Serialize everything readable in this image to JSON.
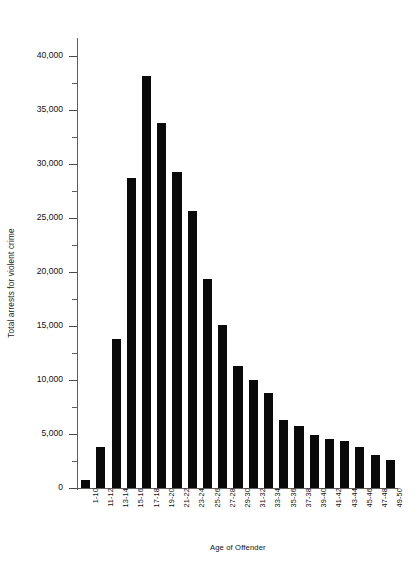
{
  "chart_data": {
    "type": "bar",
    "title": "",
    "xlabel": "Age of Offender",
    "ylabel": "Total arrests for violent crime",
    "ylim": [
      0,
      41500
    ],
    "grid": false,
    "legend": null,
    "y_ticks_major": [
      0,
      5000,
      10000,
      15000,
      20000,
      25000,
      30000,
      35000,
      40000
    ],
    "y_tick_labels": [
      "0",
      "5,000",
      "10,000",
      "15,000",
      "20,000",
      "25,000",
      "30,000",
      "35,000",
      "40,000"
    ],
    "y_ticks_minor": [
      2500,
      7500,
      12500,
      17500,
      22500,
      27500,
      32500,
      37500
    ],
    "bar_color": "#0a0a0a",
    "categories": [
      "1-10",
      "11-12",
      "13-14",
      "15-16",
      "17-18",
      "19-20",
      "21-22",
      "23-24",
      "25-26",
      "27-28",
      "29-30",
      "31-32",
      "33-34",
      "35-36",
      "37-38",
      "39-40",
      "41-42",
      "43-44",
      "45-46",
      "47-48",
      "49-50"
    ],
    "values": [
      700,
      3800,
      13800,
      28700,
      38200,
      33800,
      29300,
      25700,
      19400,
      15100,
      11300,
      10000,
      8800,
      6300,
      5700,
      4900,
      4500,
      4400,
      3800,
      3100,
      2600
    ]
  }
}
